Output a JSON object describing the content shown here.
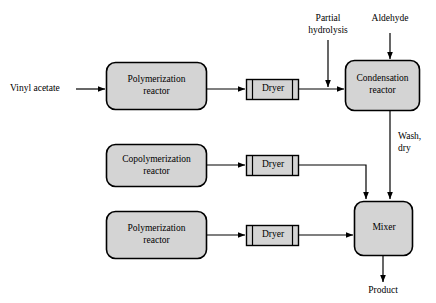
{
  "diagram": {
    "background_color": "#ffffff",
    "node_fill_color": "#d4d4d4",
    "line_color": "#000000",
    "units": {
      "reactor_top": {
        "label_line1": "Polymerization",
        "label_line2": "reactor",
        "shape": "rounded-rectangle"
      },
      "dryer_top": {
        "label": "Dryer",
        "shape": "dryer-cylinder"
      },
      "condensation_reactor": {
        "label_line1": "Condensation",
        "label_line2": "reactor",
        "shape": "rounded-rectangle"
      },
      "reactor_middle": {
        "label_line1": "Copolymerization",
        "label_line2": "reactor",
        "shape": "rounded-rectangle"
      },
      "dryer_middle": {
        "label": "Dryer",
        "shape": "dryer-cylinder"
      },
      "reactor_bottom": {
        "label_line1": "Polymerization",
        "label_line2": "reactor",
        "shape": "rounded-rectangle"
      },
      "dryer_bottom": {
        "label": "Dryer",
        "shape": "dryer-cylinder"
      },
      "mixer": {
        "label": "Mixer",
        "shape": "rounded-rectangle"
      }
    },
    "streams": {
      "feed_vinyl_acetate": "Vinyl acetate",
      "partial_hydrolysis_line1": "Partial",
      "partial_hydrolysis_line2": "hydrolysis",
      "aldehyde": "Aldehyde",
      "wash_dry_line1": "Wash,",
      "wash_dry_line2": "dry",
      "product": "Product"
    }
  }
}
